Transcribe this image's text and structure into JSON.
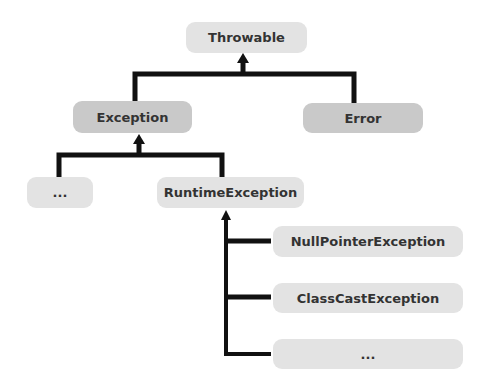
{
  "diagram": {
    "nodes": {
      "throwable": "Throwable",
      "exception": "Exception",
      "error": "Error",
      "other_exceptions": "...",
      "runtime_exception": "RuntimeException",
      "null_pointer_exception": "NullPointerException",
      "class_cast_exception": "ClassCastException",
      "other_runtime_exceptions": "..."
    },
    "edges": [
      {
        "from": "Exception",
        "to": "Throwable"
      },
      {
        "from": "Error",
        "to": "Throwable"
      },
      {
        "from": "...",
        "to": "Exception"
      },
      {
        "from": "RuntimeException",
        "to": "Exception"
      },
      {
        "from": "NullPointerException",
        "to": "RuntimeException"
      },
      {
        "from": "ClassCastException",
        "to": "RuntimeException"
      },
      {
        "from": "...",
        "to": "RuntimeException"
      }
    ],
    "colors": {
      "light_node": "#e3e3e3",
      "dark_node": "#c9c9c9",
      "connector": "#111111",
      "text": "#333333"
    }
  }
}
